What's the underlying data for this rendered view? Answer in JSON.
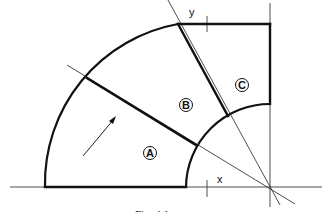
{
  "figure": {
    "caption": "Fig. 4.1",
    "axis_labels": {
      "x": "x",
      "y": "y"
    },
    "regions": [
      {
        "id": "A",
        "label": "A"
      },
      {
        "id": "B",
        "label": "B"
      },
      {
        "id": "C",
        "label": "C"
      }
    ],
    "colors": {
      "line": "#111111",
      "background": "#ffffff"
    }
  }
}
